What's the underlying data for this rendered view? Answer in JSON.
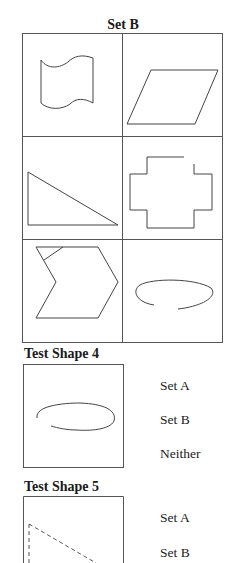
{
  "set_b": {
    "title": "Set B",
    "shapes": [
      {
        "name": "wavy-flag",
        "position": "row1-left"
      },
      {
        "name": "parallelogram",
        "position": "row1-right"
      },
      {
        "name": "right-triangle",
        "position": "row2-left"
      },
      {
        "name": "open-cross",
        "position": "row2-right"
      },
      {
        "name": "chevron-hexagon-with-line",
        "position": "row3-left"
      },
      {
        "name": "open-ellipse",
        "position": "row3-right"
      }
    ]
  },
  "test_shape_4": {
    "title": "Test Shape 4",
    "shape": "open-ellipse",
    "options": [
      "Set A",
      "Set B",
      "Neither"
    ]
  },
  "test_shape_5": {
    "title": "Test Shape 5",
    "shape": "dashed-right-triangle",
    "options": [
      "Set A",
      "Set B"
    ]
  },
  "colors": {
    "line": "#444444",
    "grid": "#555555",
    "background": "#ffffff"
  }
}
